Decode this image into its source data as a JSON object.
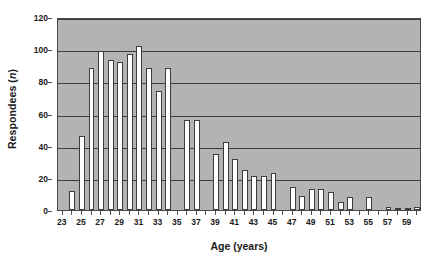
{
  "chart_data": {
    "type": "bar",
    "title": "",
    "subtitle": "",
    "xlabel": "Age (years)",
    "ylabel_text": "Respondees (",
    "ylabel_italic": "n",
    "ylabel_tail": ")",
    "ylabel_full": "Respondees (n)",
    "xlim": [
      22.5,
      60.5
    ],
    "ylim": [
      0,
      120
    ],
    "yticks": [
      0,
      20,
      40,
      60,
      80,
      100,
      120
    ],
    "ytick_labels": [
      "0",
      "20",
      "40",
      "60",
      "80",
      "100",
      "120"
    ],
    "xticks": [
      23,
      24,
      25,
      26,
      27,
      28,
      29,
      30,
      31,
      32,
      33,
      34,
      35,
      36,
      37,
      38,
      39,
      40,
      41,
      42,
      43,
      44,
      45,
      46,
      47,
      48,
      49,
      50,
      51,
      52,
      53,
      54,
      55,
      56,
      57,
      58,
      59,
      60
    ],
    "xtick_labels_shown": [
      23,
      25,
      27,
      29,
      31,
      33,
      35,
      37,
      39,
      41,
      43,
      45,
      47,
      49,
      51,
      53,
      55,
      57,
      59
    ],
    "grid": "horizontal",
    "legend": "none",
    "plot_background": "#b3b3b3",
    "bar_fill": "#ffffff",
    "bar_edge": "#3d3d3d",
    "grid_color": "#3d3d3d",
    "axis_color": "#4a4a4a",
    "text_color": "#1a1a1a",
    "categories": [
      23,
      24,
      25,
      26,
      27,
      28,
      29,
      30,
      31,
      32,
      33,
      34,
      35,
      36,
      37,
      38,
      39,
      40,
      41,
      42,
      43,
      44,
      45,
      46,
      47,
      48,
      49,
      50,
      51,
      52,
      53,
      54,
      55,
      56,
      57,
      58,
      59,
      60
    ],
    "values": [
      0,
      12,
      46,
      88,
      99,
      93,
      92,
      97,
      102,
      88,
      74,
      88,
      0,
      56,
      56,
      0,
      35,
      42,
      32,
      25,
      21,
      21,
      23,
      0,
      14,
      9,
      13,
      13,
      11,
      5,
      8,
      0,
      8,
      0,
      2,
      1,
      1,
      2
    ],
    "series": [
      {
        "name": "Respondees",
        "points": [
          {
            "age": 23,
            "value": 0
          },
          {
            "age": 24,
            "value": 12
          },
          {
            "age": 25,
            "value": 46
          },
          {
            "age": 26,
            "value": 88
          },
          {
            "age": 27,
            "value": 99
          },
          {
            "age": 28,
            "value": 93
          },
          {
            "age": 29,
            "value": 92
          },
          {
            "age": 30,
            "value": 97
          },
          {
            "age": 31,
            "value": 102
          },
          {
            "age": 32,
            "value": 88
          },
          {
            "age": 33,
            "value": 74
          },
          {
            "age": 34,
            "value": 88
          },
          {
            "age": 35,
            "value": 0
          },
          {
            "age": 36,
            "value": 56
          },
          {
            "age": 37,
            "value": 56
          },
          {
            "age": 38,
            "value": 0
          },
          {
            "age": 39,
            "value": 35
          },
          {
            "age": 40,
            "value": 42
          },
          {
            "age": 41,
            "value": 32
          },
          {
            "age": 42,
            "value": 25
          },
          {
            "age": 43,
            "value": 21
          },
          {
            "age": 44,
            "value": 21
          },
          {
            "age": 45,
            "value": 23
          },
          {
            "age": 46,
            "value": 0
          },
          {
            "age": 47,
            "value": 14
          },
          {
            "age": 48,
            "value": 9
          },
          {
            "age": 49,
            "value": 13
          },
          {
            "age": 50,
            "value": 13
          },
          {
            "age": 51,
            "value": 11
          },
          {
            "age": 52,
            "value": 5
          },
          {
            "age": 53,
            "value": 8
          },
          {
            "age": 54,
            "value": 0
          },
          {
            "age": 55,
            "value": 8
          },
          {
            "age": 56,
            "value": 0
          },
          {
            "age": 57,
            "value": 2
          },
          {
            "age": 58,
            "value": 1
          },
          {
            "age": 59,
            "value": 1
          },
          {
            "age": 60,
            "value": 2
          }
        ]
      }
    ]
  }
}
